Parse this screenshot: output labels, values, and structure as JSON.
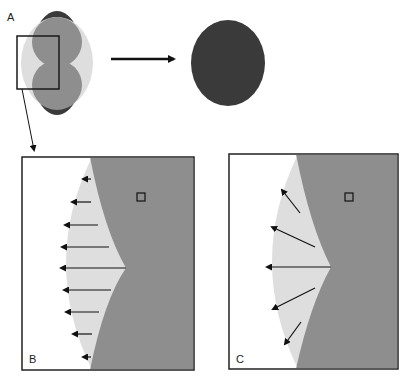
{
  "figure": {
    "panels": [
      {
        "id": "A",
        "label": "A",
        "description": "Cell with two overlapping lobes (grey) inside lighter halo and dark outer contour; zoom box on left edge"
      },
      {
        "id": "B",
        "label": "B",
        "description": "Close-up: horizontal arrows pointing outward from concave cusp boundary"
      },
      {
        "id": "C",
        "label": "C",
        "description": "Close-up: arrows radiating normal to the boundary from cusp"
      }
    ],
    "transition_arrow": {
      "from": "A",
      "to": "rounded-cell",
      "direction": "right"
    },
    "panel_b_arrows": 9,
    "panel_c_arrows": 5
  },
  "colors": {
    "dark_cell": "#3a3a3a",
    "grey_cell": "#8e8e8e",
    "halo": "#dedede",
    "border": "#222222",
    "background": "#ffffff"
  }
}
